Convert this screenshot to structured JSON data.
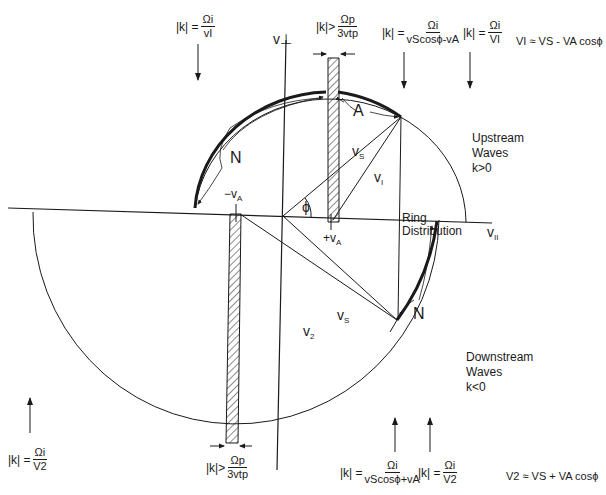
{
  "axes": {
    "v_perp": "v⊥",
    "v_par": "v",
    "v_par_sub": "II"
  },
  "velocities": {
    "minus_vA": "−v",
    "plus_vA": "+v",
    "sub_A": "A",
    "vs": "v",
    "vs_sub": "S",
    "v1": "v",
    "v1_sub": "I",
    "v2": "v",
    "v2_sub": "2",
    "phi": "ϕ"
  },
  "arc_labels": {
    "N_upper": "N",
    "A_upper": "A",
    "N_lower": "N"
  },
  "regions": {
    "ring": [
      "Ring",
      "Distribution"
    ],
    "upstream": [
      "Upstream",
      "Waves",
      "k>0"
    ],
    "downstream": [
      "Downstream",
      "Waves",
      "k<0"
    ]
  },
  "equations": {
    "top_left": {
      "lhs": "|k| =",
      "num": "Ωi",
      "den": "vI"
    },
    "top_bar": {
      "lhs": "|k|>",
      "num": "Ωp",
      "den": "3vtp"
    },
    "top_right1": {
      "lhs": "|k| =",
      "num": "Ωi",
      "den": "vScosϕ-vA"
    },
    "top_right2": {
      "lhs": "|k| =",
      "num": "Ωi",
      "den": "VI"
    },
    "v1_approx": "VI ≈ VS - VA cosϕ",
    "bottom_left": {
      "lhs": "|k| =",
      "num": "Ωi",
      "den": "V2"
    },
    "bottom_bar": {
      "lhs": "|k|>",
      "num": "Ωp",
      "den": "3vtp"
    },
    "bottom_right1": {
      "lhs": "|k| =",
      "num": "Ωi",
      "den": "vScosϕ+vA"
    },
    "bottom_right2": {
      "lhs": "|k| =",
      "num": "Ωi",
      "den": "V2"
    },
    "v2_approx": "V2 ≈ VS + VA cosϕ"
  },
  "colors": {
    "ink": "#1a1a1a",
    "background": "#ffffff"
  }
}
